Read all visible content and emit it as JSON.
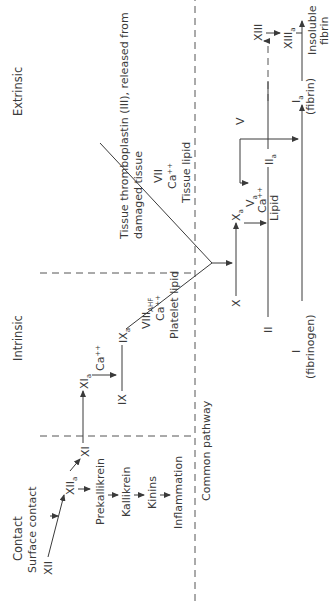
{
  "diagram": {
    "orientation": "rotated -90deg",
    "sections": {
      "contact": "Contact",
      "intrinsic": "Intrinsic",
      "extrinsic": "Extrinsic",
      "common_pathway": "Common pathway"
    },
    "contact": {
      "xii": "XII",
      "surface_contact": "Surface contact",
      "xiia": "XII",
      "xiia_sub": "a",
      "xi": "XI",
      "prekallikrein": "Prekallikrein",
      "kallikrein": "Kallikrein",
      "kinins": "Kinins",
      "inflammation": "Inflammation"
    },
    "intrinsic": {
      "xia": "XI",
      "xia_sub": "a",
      "ca": "Ca",
      "ca_sup": "++",
      "ix": "IX",
      "ixa": "IX",
      "ixa_sub": "a",
      "viii": "VIII",
      "viii_sub": "AHF",
      "ca2": "Ca",
      "ca2_sup": "++",
      "platelet_lipid": "Platelet lipid"
    },
    "extrinsic": {
      "tissue_line1": "Tissue thromboplastin (III), released from",
      "tissue_line2": "damaged tissue",
      "vii": "VII",
      "ca": "Ca",
      "ca_sup": "++",
      "tissue_lipid": "Tissue lipid"
    },
    "common": {
      "x": "X",
      "xa": "X",
      "xa_sub": "a",
      "va": "V",
      "va_sub": "a",
      "ca": "Ca",
      "ca_sup": "++",
      "lipid": "Lipid",
      "v": "V",
      "ii": "II",
      "iia": "II",
      "iia_sub": "a",
      "i": "I",
      "fibrinogen": "(fibrinogen)",
      "ia": "I",
      "ia_sub": "a",
      "fibrin": "(fibrin)",
      "xiii": "XIII",
      "xiiia": "XIII",
      "xiiia_sub": "a",
      "insoluble": "Insoluble",
      "fibrin2": "fibrin"
    }
  }
}
